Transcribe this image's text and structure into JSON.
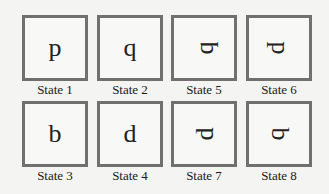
{
  "states": [
    {
      "label": "State 1",
      "glyph": "p",
      "rotation": 0
    },
    {
      "label": "State 2",
      "glyph": "q",
      "rotation": 0
    },
    {
      "label": "State 5",
      "glyph": "q",
      "rotation": -90
    },
    {
      "label": "State 6",
      "glyph": "p",
      "rotation": 90
    },
    {
      "label": "State 3",
      "glyph": "b",
      "rotation": 0
    },
    {
      "label": "State 4",
      "glyph": "d",
      "rotation": 0
    },
    {
      "label": "State 7",
      "glyph": "d",
      "rotation": -90
    },
    {
      "label": "State 8",
      "glyph": "b",
      "rotation": 90
    }
  ],
  "colors": {
    "border": "#707070",
    "background": "#f4f4f2",
    "text": "#1a1a1a"
  }
}
